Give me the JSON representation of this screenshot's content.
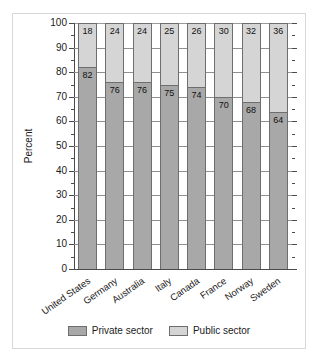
{
  "chart_data": {
    "type": "bar",
    "subtype": "stacked-bar-100",
    "title": "",
    "xlabel": "",
    "ylabel": "Percent",
    "ylim": [
      0,
      100
    ],
    "ytick_step": 10,
    "yminor_step": 5,
    "grid": true,
    "grid_axis": "y",
    "legend_position": "bottom-center",
    "categories": [
      "United States",
      "Germany",
      "Australia",
      "Italy",
      "Canada",
      "France",
      "Norway",
      "Sweden"
    ],
    "ytick_labels": [
      "100",
      "90",
      "80",
      "70",
      "60",
      "50",
      "40",
      "30",
      "20",
      "10",
      "0"
    ],
    "series": [
      {
        "name": "Private sector",
        "color": "#a8a8a8",
        "values": [
          82,
          76,
          76,
          75,
          74,
          70,
          68,
          64
        ]
      },
      {
        "name": "Public sector",
        "color": "#d5d5d5",
        "values": [
          18,
          24,
          24,
          25,
          26,
          30,
          32,
          36
        ]
      }
    ]
  },
  "legend": {
    "items": [
      {
        "label": "Private sector",
        "swatch": "private"
      },
      {
        "label": "Public sector",
        "swatch": "public"
      }
    ]
  },
  "colors": {
    "private_sector": "#a8a8a8",
    "public_sector": "#d5d5d5",
    "axis": "#4a4a4a",
    "gridline": "#8f8f8f",
    "text": "#1b1b1b",
    "background": "#ffffff",
    "frame": "#d8d8d8"
  }
}
